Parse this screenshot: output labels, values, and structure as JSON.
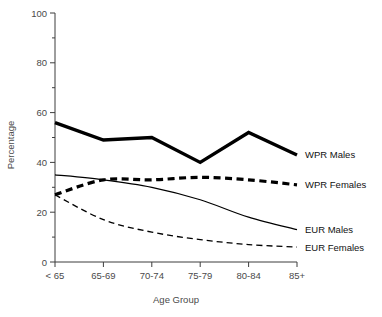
{
  "chart_data": {
    "type": "line",
    "title": "",
    "xlabel": "Age Group",
    "ylabel": "Percentage",
    "categories": [
      "< 65",
      "65-69",
      "70-74",
      "75-79",
      "80-84",
      "85+"
    ],
    "ylim": [
      0,
      100
    ],
    "yticks": [
      0,
      20,
      40,
      60,
      80,
      100
    ],
    "yticks_minor": [
      10,
      30,
      50,
      70,
      90
    ],
    "grid": false,
    "legend_position": "right-inline",
    "series": [
      {
        "name": "WPR Males",
        "style": "thick-solid",
        "color": "#000000",
        "values": [
          56,
          49,
          50,
          40,
          52,
          43
        ]
      },
      {
        "name": "WPR Females",
        "style": "thick-dashed",
        "color": "#000000",
        "values": [
          27,
          33,
          33,
          34,
          33,
          31
        ]
      },
      {
        "name": "EUR Males",
        "style": "thin-solid",
        "color": "#000000",
        "values": [
          35,
          33,
          30,
          25,
          18,
          13
        ]
      },
      {
        "name": "EUR Females",
        "style": "thin-dashed",
        "color": "#000000",
        "values": [
          27,
          17,
          12,
          9,
          7,
          6
        ]
      }
    ]
  },
  "axes": {
    "y_tick_labels": [
      "0",
      "20",
      "40",
      "60",
      "80",
      "100"
    ],
    "x_tick_labels": [
      "< 65",
      "65-69",
      "70-74",
      "75-79",
      "80-84",
      "85+"
    ],
    "x_axis_title": "Age Group",
    "y_axis_title": "Percentage"
  },
  "legend": {
    "entries": [
      {
        "label": "WPR Males"
      },
      {
        "label": "WPR Females"
      },
      {
        "label": "EUR Males"
      },
      {
        "label": "EUR Females"
      }
    ]
  }
}
